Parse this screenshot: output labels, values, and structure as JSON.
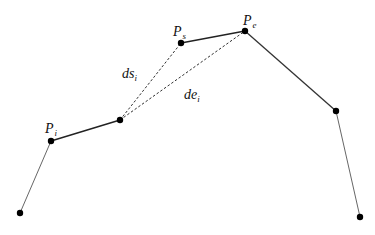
{
  "diagram": {
    "background": "#ffffff",
    "stroke_color": "#222222",
    "points": [
      {
        "id": "p0",
        "x": 20,
        "y": 213
      },
      {
        "id": "pi",
        "x": 51,
        "y": 141
      },
      {
        "id": "p2",
        "x": 120,
        "y": 120
      },
      {
        "id": "ps",
        "x": 181,
        "y": 43
      },
      {
        "id": "pe",
        "x": 245,
        "y": 31
      },
      {
        "id": "p5",
        "x": 336,
        "y": 111
      },
      {
        "id": "p6",
        "x": 360,
        "y": 217
      }
    ],
    "segments": [
      {
        "from": "p0",
        "to": "pi",
        "style": "thin"
      },
      {
        "from": "pi",
        "to": "p2",
        "style": "thick"
      },
      {
        "from": "ps",
        "to": "pe",
        "style": "thick"
      },
      {
        "from": "pe",
        "to": "p5",
        "style": "thick"
      },
      {
        "from": "p5",
        "to": "p6",
        "style": "thin"
      }
    ],
    "dashed_segments": [
      {
        "from": "p2",
        "to": "ps",
        "label": "ds_i"
      },
      {
        "from": "p2",
        "to": "pe",
        "label": "de_i"
      }
    ],
    "labels": {
      "pi": {
        "main": "P",
        "sub": "i"
      },
      "ps": {
        "main": "P",
        "sub": "s"
      },
      "pe": {
        "main": "P",
        "sub": "e"
      },
      "ds": {
        "main": "ds",
        "sub": "i"
      },
      "de": {
        "main": "de",
        "sub": "i"
      }
    }
  }
}
